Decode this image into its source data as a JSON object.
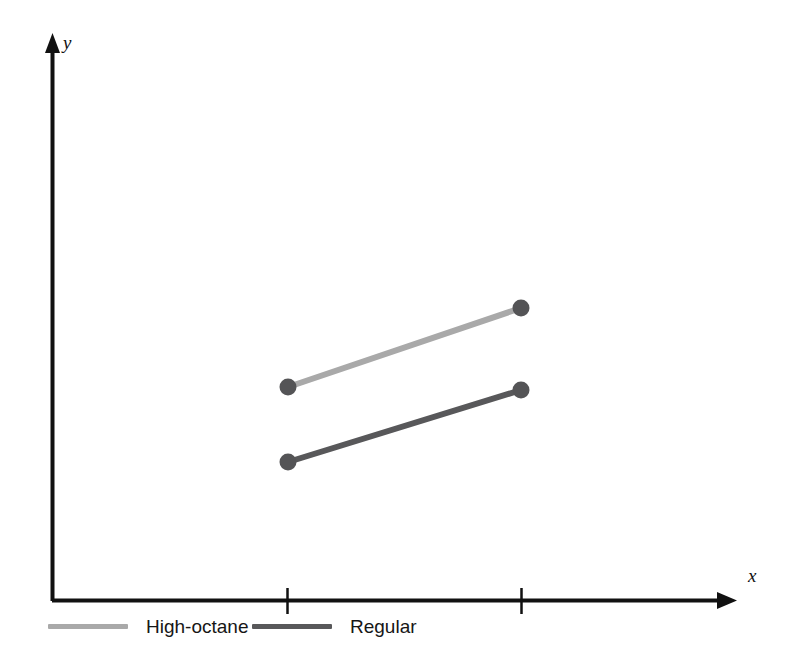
{
  "chart_data": {
    "type": "line",
    "title": "",
    "subtitle": "",
    "xlabel": "x",
    "ylabel": "y",
    "x": [
      1,
      2
    ],
    "tick_labels": [
      "",
      ""
    ],
    "grid": false,
    "legend_position": "bottom-left",
    "axis_style": "arrow-axes",
    "series": [
      {
        "name": "High-octane",
        "color": "#a9a9a9",
        "marker_color": "#545456",
        "values": [
          387,
          308
        ],
        "points": [
          {
            "x": 288,
            "y": 387
          },
          {
            "x": 521,
            "y": 308
          }
        ]
      },
      {
        "name": "Regular",
        "color": "#58585a",
        "marker_color": "#545456",
        "values": [
          462,
          390
        ],
        "points": [
          {
            "x": 288,
            "y": 462
          },
          {
            "x": 521,
            "y": 390
          }
        ]
      }
    ],
    "annotations": []
  },
  "axes": {
    "y_label": "y",
    "x_label": "x",
    "origin_x": 52,
    "origin_y": 601,
    "y_top": 38,
    "x_right": 735,
    "axis_color": "#111111",
    "ticks_x": [
      287,
      521
    ]
  },
  "legend": {
    "items": [
      {
        "label": "High-octane",
        "color": "#a9a9a9"
      },
      {
        "label": "Regular",
        "color": "#58585a"
      }
    ]
  },
  "colors": {
    "background": "#ffffff",
    "axis": "#111111",
    "series_light": "#a9a9a9",
    "series_dark": "#58585a",
    "marker": "#545456",
    "text": "#161616"
  }
}
